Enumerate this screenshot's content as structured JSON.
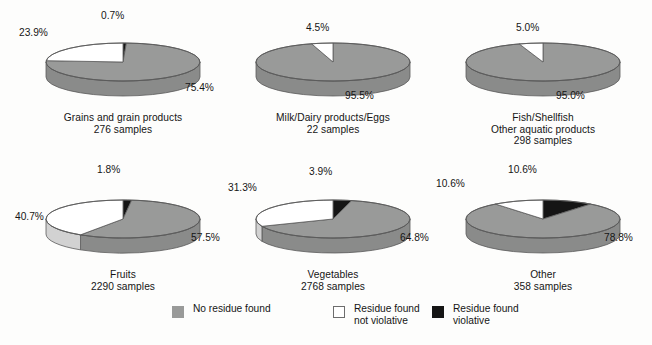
{
  "chart_data": {
    "type": "pie",
    "title": "",
    "legend_position": "bottom",
    "series_names": [
      "No residue found",
      "Residue found not violative",
      "Residue found violative"
    ],
    "series_colors": [
      "#999a99",
      "#ffffff",
      "#151515"
    ],
    "charts": [
      {
        "name": "Grains and grain products",
        "samples_label": "276 samples",
        "caption": "Grains and grain products\n276 samples",
        "slices": [
          {
            "label": "No residue found",
            "value": 75.4,
            "display": "75.4%",
            "color": "#999a99"
          },
          {
            "label": "Residue found not violative",
            "value": 23.9,
            "display": "23.9%",
            "color": "#ffffff"
          },
          {
            "label": "Residue found violative",
            "value": 0.7,
            "display": "0.7%",
            "color": "#151515"
          }
        ]
      },
      {
        "name": "Milk/Dairy products/Eggs",
        "samples_label": "22 samples",
        "caption": "Milk/Dairy products/Eggs\n22 samples",
        "slices": [
          {
            "label": "No residue found",
            "value": 95.5,
            "display": "95.5%",
            "color": "#999a99"
          },
          {
            "label": "Residue found not violative",
            "value": 4.5,
            "display": "4.5%",
            "color": "#ffffff"
          },
          {
            "label": "Residue found violative",
            "value": 0.0,
            "display": "",
            "color": "#151515"
          }
        ]
      },
      {
        "name": "Fish/Shellfish Other aquatic products",
        "samples_label": "298 samples",
        "caption": "Fish/Shellfish\nOther aquatic products\n298 samples",
        "slices": [
          {
            "label": "No residue found",
            "value": 95.0,
            "display": "95.0%",
            "color": "#999a99"
          },
          {
            "label": "Residue found not violative",
            "value": 5.0,
            "display": "5.0%",
            "color": "#ffffff"
          },
          {
            "label": "Residue found violative",
            "value": 0.0,
            "display": "",
            "color": "#151515"
          }
        ]
      },
      {
        "name": "Fruits",
        "samples_label": "2290 samples",
        "caption": "Fruits\n2290 samples",
        "slices": [
          {
            "label": "No residue found",
            "value": 57.5,
            "display": "57.5%",
            "color": "#999a99"
          },
          {
            "label": "Residue found not violative",
            "value": 40.7,
            "display": "40.7%",
            "color": "#ffffff"
          },
          {
            "label": "Residue found violative",
            "value": 1.8,
            "display": "1.8%",
            "color": "#151515"
          }
        ]
      },
      {
        "name": "Vegetables",
        "samples_label": "2768 samples",
        "caption": "Vegetables\n2768 samples",
        "slices": [
          {
            "label": "No residue found",
            "value": 64.8,
            "display": "64.8%",
            "color": "#999a99"
          },
          {
            "label": "Residue found not violative",
            "value": 31.3,
            "display": "31.3%",
            "color": "#ffffff"
          },
          {
            "label": "Residue found violative",
            "value": 3.9,
            "display": "3.9%",
            "color": "#151515"
          }
        ]
      },
      {
        "name": "Other",
        "samples_label": "358 samples",
        "caption": "Other\n358 samples",
        "slices": [
          {
            "label": "No residue found",
            "value": 78.8,
            "display": "78.8%",
            "color": "#999a99"
          },
          {
            "label": "Residue found not violative",
            "value": 10.6,
            "display": "10.6%",
            "color": "#ffffff"
          },
          {
            "label": "Residue found violative",
            "value": 10.6,
            "display": "10.6%",
            "color": "#151515"
          }
        ]
      }
    ]
  },
  "legend": {
    "entries": [
      {
        "label": "No residue found",
        "swatch": "gray",
        "color": "#999a99"
      },
      {
        "label": "Residue found\nnot violative",
        "swatch": "white",
        "color": "#ffffff"
      },
      {
        "label": "Residue found\nviolative",
        "swatch": "black",
        "color": "#151515"
      }
    ]
  },
  "colors": {
    "background": "#fdfdfc",
    "pie_gray_top": "#999a99",
    "pie_gray_side": "#8a8b8a",
    "pie_white_top": "#ffffff",
    "pie_white_side": "#d2d2d2",
    "pie_black_top": "#151515",
    "pie_black_side": "#0b0b0b",
    "outline": "#5a5a5a",
    "text": "#151515"
  }
}
